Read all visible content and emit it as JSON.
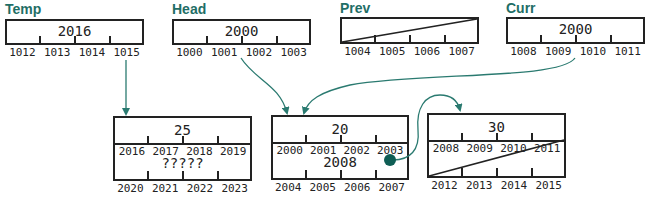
{
  "top_pointers": [
    {
      "name": "Temp",
      "value": "2016",
      "addresses": [
        "1012",
        "1013",
        "1014",
        "1015"
      ],
      "slashed": false
    },
    {
      "name": "Head",
      "value": "2000",
      "addresses": [
        "1000",
        "1001",
        "1002",
        "1003"
      ],
      "slashed": false
    },
    {
      "name": "Prev",
      "value": "",
      "addresses": [
        "1004",
        "1005",
        "1006",
        "1007"
      ],
      "slashed": true
    },
    {
      "name": "Curr",
      "value": "2000",
      "addresses": [
        "1008",
        "1009",
        "1010",
        "1011"
      ],
      "slashed": false
    }
  ],
  "nodes": [
    {
      "id": "node-25",
      "data": "25",
      "data_addresses": [
        "2016",
        "2017",
        "2018",
        "2019"
      ],
      "next": "?????",
      "next_addresses": [
        "2020",
        "2021",
        "2022",
        "2023"
      ],
      "next_slashed": false,
      "next_dot": false
    },
    {
      "id": "node-20",
      "data": "20",
      "data_addresses": [
        "2000",
        "2001",
        "2002",
        "2003"
      ],
      "next": "2008",
      "next_addresses": [
        "2004",
        "2005",
        "2006",
        "2007"
      ],
      "next_slashed": false,
      "next_dot": true
    },
    {
      "id": "node-30",
      "data": "30",
      "data_addresses": [
        "2008",
        "2009",
        "2010",
        "2011"
      ],
      "next": "",
      "next_addresses": [
        "2012",
        "2013",
        "2014",
        "2015"
      ],
      "next_slashed": true,
      "next_dot": false
    }
  ],
  "arrows": [
    {
      "from": "Temp",
      "to": "node-25"
    },
    {
      "from": "Head",
      "to": "node-20"
    },
    {
      "from": "Curr",
      "to": "node-20"
    },
    {
      "from": "node-20.next",
      "to": "node-30"
    }
  ],
  "colors": {
    "arrow": "#2a7a70",
    "title": "#1f6e66",
    "dot": "#0f5e55",
    "line": "#222222"
  }
}
